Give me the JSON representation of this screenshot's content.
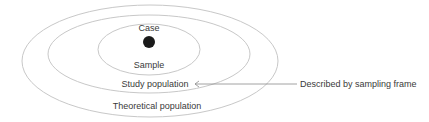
{
  "diagram": {
    "type": "nested-ellipses",
    "labels": {
      "case": "Case",
      "sample": "Sample",
      "study_population": "Study population",
      "theoretical_population": "Theoretical population",
      "annotation": "Described by sampling frame"
    },
    "colors": {
      "ellipse_stroke": "#c8c8c8",
      "dot": "#1a1a1a",
      "arrow": "#8a8a8a",
      "text": "#3a3a3a"
    }
  }
}
